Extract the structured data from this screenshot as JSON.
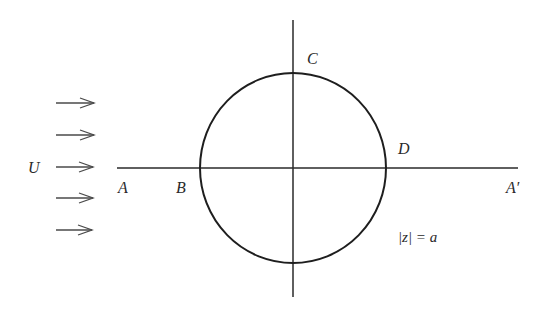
{
  "figure": {
    "type": "flow-past-circular-cylinder",
    "colors": {
      "ink": "#1e1e1e",
      "arrow": "#4a4a4a",
      "background": "#ffffff"
    }
  },
  "labels": {
    "free_stream": "U",
    "point_A": "A",
    "point_B": "B",
    "point_C": "C",
    "point_D": "D",
    "point_A_prime": "A′",
    "circle_equation": "|z| = a"
  },
  "geometry": {
    "circle": {
      "cx": 293,
      "cy": 168,
      "rx": 93,
      "ry": 95
    },
    "horizontal_axis": {
      "x1": 117,
      "x2": 518,
      "y": 168
    },
    "vertical_axis": {
      "x": 293,
      "y1": 20,
      "y2": 297
    },
    "flow_arrows": [
      {
        "y": 103
      },
      {
        "y": 135
      },
      {
        "y": 167
      },
      {
        "y": 198
      },
      {
        "y": 230
      }
    ]
  }
}
